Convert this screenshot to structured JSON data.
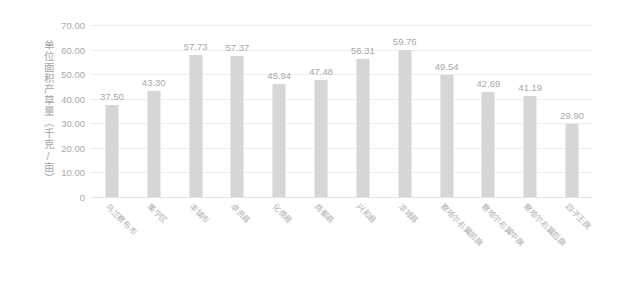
{
  "chart_data": {
    "type": "bar",
    "title": "",
    "subtitle": "",
    "xlabel": "",
    "ylabel": "单位面积产草量（千克/亩）",
    "ylim": [
      0,
      70
    ],
    "ytick_labels": [
      "70.00",
      "60.00",
      "50.00",
      "40.00",
      "30.00",
      "20.00",
      "10.00",
      "0"
    ],
    "ytick_values": [
      70,
      60,
      50,
      40,
      30,
      20,
      10,
      0
    ],
    "grid": true,
    "legend": false,
    "legend_position": "none",
    "bar_color": "#d6d6d6",
    "gridline_color": "#ededed",
    "text_color": "#a9a9a9",
    "categories": [
      "乌兰察布市",
      "集宁区",
      "丰镇市",
      "卓资县",
      "化德县",
      "商都县",
      "兴和县",
      "凉城县",
      "察哈尔右翼前旗",
      "察哈尔右翼中旗",
      "察哈尔右翼后旗",
      "四子王旗"
    ],
    "values": [
      37.5,
      43.3,
      57.73,
      57.37,
      45.94,
      47.48,
      56.31,
      59.76,
      49.54,
      42.69,
      41.19,
      29.9
    ],
    "value_labels": [
      "37.50",
      "43.30",
      "57.73",
      "57.37",
      "45.94",
      "47.48",
      "56.31",
      "59.76",
      "49.54",
      "42.69",
      "41.19",
      "29.90"
    ]
  }
}
